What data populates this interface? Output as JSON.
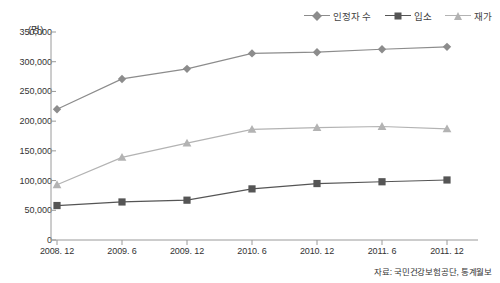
{
  "chart_data": {
    "type": "line",
    "title": "",
    "subtitle": "",
    "xlabel": "",
    "ylabel": "",
    "unit_label": "(명)",
    "categories": [
      "2008. 12",
      "2009. 6",
      "2009. 12",
      "2010. 6",
      "2010. 12",
      "2011. 6",
      "2011. 12"
    ],
    "series": [
      {
        "name": "인정자 수",
        "marker": "diamond",
        "color": "#8c8c8c",
        "values": [
          220000,
          271000,
          288000,
          314000,
          316000,
          321000,
          325000
        ]
      },
      {
        "name": "입소",
        "marker": "square",
        "color": "#555555",
        "values": [
          58000,
          64000,
          67000,
          86000,
          95000,
          98000,
          101000
        ]
      },
      {
        "name": "재가",
        "marker": "triangle",
        "color": "#b3b3b3",
        "values": [
          93000,
          139000,
          163000,
          186000,
          189000,
          191000,
          187000
        ]
      }
    ],
    "ylim": [
      0,
      350000
    ],
    "ytick_values": [
      0,
      50000,
      100000,
      150000,
      200000,
      250000,
      300000,
      350000
    ],
    "ytick_labels": [
      "0",
      "50,000",
      "100,000",
      "150,000",
      "200,000",
      "250,000",
      "300,000",
      "350,000"
    ],
    "grid": false,
    "legend_position": "top-right"
  },
  "source": {
    "text": "자료: 국민건강보험공단, 통계월보"
  },
  "colors": {
    "axis": "#9a9a9a",
    "text": "#333333",
    "background": "#ffffff"
  }
}
